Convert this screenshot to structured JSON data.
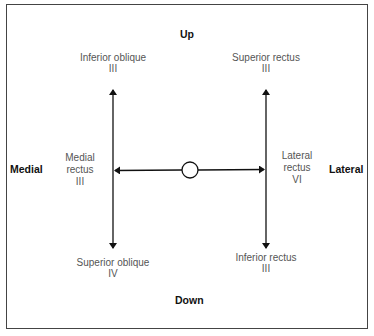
{
  "directions": {
    "up": "Up",
    "down": "Down",
    "medial": "Medial",
    "lateral": "Lateral"
  },
  "muscles": {
    "inferior_oblique": {
      "name": "Inferior oblique",
      "nerve": "III"
    },
    "superior_rectus": {
      "name": "Superior rectus",
      "nerve": "III"
    },
    "medial_rectus": {
      "line1": "Medial",
      "line2": "rectus",
      "nerve": "III"
    },
    "lateral_rectus": {
      "line1": "Lateral",
      "line2": "rectus",
      "nerve": "VI"
    },
    "superior_oblique": {
      "name": "Superior oblique",
      "nerve": "IV"
    },
    "inferior_rectus": {
      "name": "Inferior rectus",
      "nerve": "III"
    }
  },
  "colors": {
    "line": "#111111",
    "label_text": "#555555",
    "direction_text": "#111111",
    "border": "#444444"
  }
}
